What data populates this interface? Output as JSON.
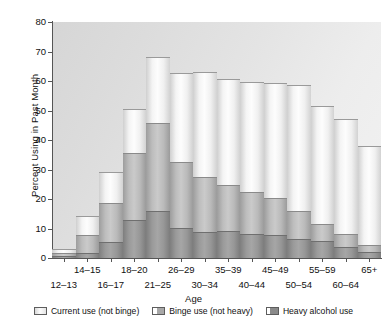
{
  "chart_data": {
    "type": "bar",
    "stacked": true,
    "title": "",
    "xlabel": "Age",
    "ylabel": "Percent Using in Past Month",
    "ylim": [
      0,
      80
    ],
    "ytick_values": [
      0,
      10,
      20,
      30,
      40,
      50,
      60,
      70,
      80
    ],
    "grid": false,
    "legend_position": "bottom",
    "categories": [
      "12–13",
      "14–15",
      "16–17",
      "18–20",
      "21–25",
      "26–29",
      "30–34",
      "35–39",
      "40–44",
      "45–49",
      "50–54",
      "55–59",
      "60–64",
      "65+"
    ],
    "series": [
      {
        "name": "Heavy alcohol use",
        "values": [
          0.8,
          1.6,
          5.4,
          13.0,
          15.9,
          10.3,
          8.8,
          9.0,
          8.3,
          7.8,
          6.6,
          5.6,
          3.6,
          2.0
        ]
      },
      {
        "name": "Binge use (not heavy)",
        "values": [
          1.0,
          6.1,
          13.4,
          22.5,
          29.9,
          22.3,
          18.6,
          15.8,
          14.1,
          12.4,
          9.4,
          6.1,
          4.6,
          2.4
        ]
      },
      {
        "name": "Current use (not binge)",
        "values": [
          1.4,
          6.7,
          10.2,
          15.0,
          22.2,
          30.1,
          35.5,
          36.0,
          37.2,
          39.0,
          42.5,
          40.0,
          38.9,
          33.6
        ]
      }
    ],
    "totals": [
      3.2,
      14.4,
      29.0,
      50.5,
      68.0,
      62.7,
      62.9,
      60.8,
      59.6,
      59.2,
      58.5,
      51.7,
      47.1,
      38.0
    ],
    "legend_entries": [
      {
        "label": "Current use (not binge)",
        "key": "current"
      },
      {
        "label": "Binge use (not heavy)",
        "key": "binge"
      },
      {
        "label": "Heavy alcohol use",
        "key": "heavy"
      }
    ],
    "colors": {
      "plot_background": "#e3e3e3",
      "axis": "#555555",
      "current": "#f4f4f4",
      "binge": "#bcbcbc",
      "heavy": "#9a9a9a",
      "text": "#111111"
    }
  }
}
